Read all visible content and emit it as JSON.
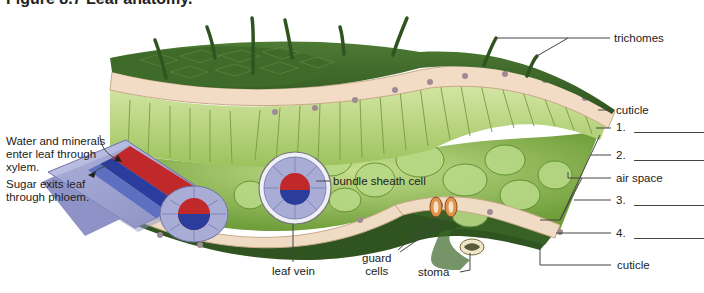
{
  "figure": {
    "title": "Figure 8.7 Leaf anatomy."
  },
  "labels": {
    "water_minerals": [
      "Water and minerals",
      "enter leaf through",
      "xylem."
    ],
    "sugar_exits": [
      "Sugar exits leaf",
      "through phloem."
    ],
    "trichomes": "trichomes",
    "cuticle_top": "cuticle",
    "blank_1": "1.",
    "blank_2": "2.",
    "air_space": "air space",
    "blank_3": "3.",
    "blank_4": "4.",
    "cuticle_bottom": "cuticle",
    "bundle_sheath_cell": "bundle sheath cell",
    "leaf_vein": "leaf vein",
    "guard_cells": [
      "guard",
      "cells"
    ],
    "stoma": "stoma"
  },
  "colors": {
    "epidermis_dark_green": "#3f6b2a",
    "epidermis_light": "#f2dcc6",
    "palisade_green": "#b6d27a",
    "spongy_green": "#8fba55",
    "xylem_red": "#c0282a",
    "phloem_blue": "#2b3d9c",
    "sheath_lavender": "#a9add6",
    "leader_line": "#444444"
  }
}
